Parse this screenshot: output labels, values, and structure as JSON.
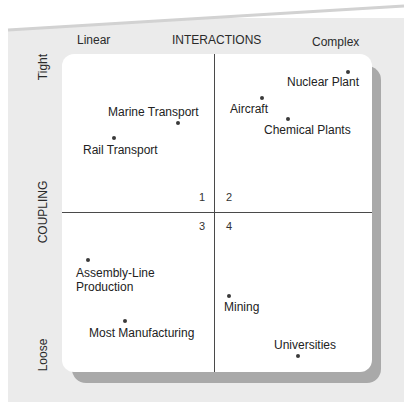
{
  "diagram": {
    "x_axis": {
      "title": "INTERACTIONS",
      "low": "Linear",
      "high": "Complex"
    },
    "y_axis": {
      "title": "COUPLING",
      "high": "Tight",
      "low": "Loose"
    },
    "quadrants": [
      "1",
      "2",
      "3",
      "4"
    ],
    "points": [
      {
        "label": "Marine Transport",
        "quadrant": 1
      },
      {
        "label": "Rail Transport",
        "quadrant": 1
      },
      {
        "label": "Nuclear Plant",
        "quadrant": 2
      },
      {
        "label": "Aircraft",
        "quadrant": 2
      },
      {
        "label": "Chemical Plants",
        "quadrant": 2
      },
      {
        "label": "Assembly-Line",
        "label2": "Production",
        "quadrant": 3
      },
      {
        "label": "Most Manufacturing",
        "quadrant": 3
      },
      {
        "label": "Mining",
        "quadrant": 4
      },
      {
        "label": "Universities",
        "quadrant": 4
      }
    ]
  },
  "colors": {
    "background": "#ebebeb",
    "panel": "#ffffff",
    "shadow": "#a9a9a9",
    "line": "#4a4a4a"
  }
}
